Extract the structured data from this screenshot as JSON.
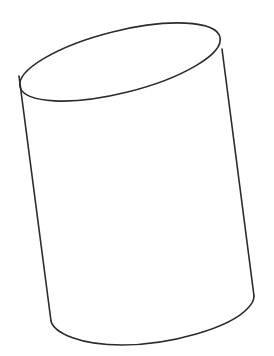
{
  "figure": {
    "background": "#ffffff",
    "stroke_color": "#2b2b2b",
    "stroke_width": 1.6,
    "top_ellipse": {
      "cx": 120,
      "cy": 62,
      "rx": 103,
      "ry": 31,
      "rotation_deg": -14
    },
    "left_edge": {
      "x1": 19,
      "y1": 76,
      "x2": 51,
      "y2": 321
    },
    "right_edge": {
      "x1": 222,
      "y1": 49,
      "x2": 254,
      "y2": 296
    },
    "bottom_curve_path": "M51 321 C 54 333, 80 345, 122 345 C 170 345, 230 328, 248 308 C 253 303, 254 300, 254 296"
  }
}
